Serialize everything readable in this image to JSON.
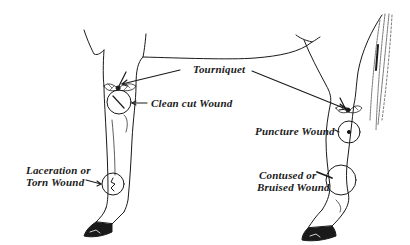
{
  "diagram": {
    "colors": {
      "ink": "#1a1a1a",
      "background": "#ffffff"
    },
    "labels": {
      "tourniquet": "Tourniquet",
      "clean_cut": "Clean cut Wound",
      "puncture": "Puncture Wound",
      "laceration_line1": "Laceration or",
      "laceration_line2": "Torn Wound",
      "contused_line1": "Contused or",
      "contused_line2": "Bruised Wound"
    }
  }
}
